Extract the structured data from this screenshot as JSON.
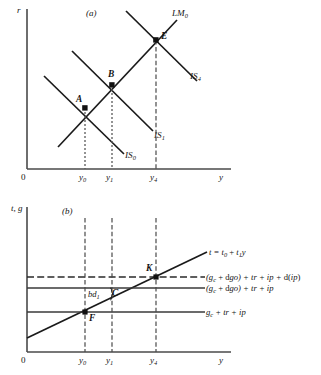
{
  "figure": {
    "panels": [
      {
        "id": "a",
        "panel_label": "(a)",
        "y_axis_label": "r",
        "x_axis_label": "y",
        "origin_label": "0",
        "x_ticks": [
          "y",
          "y",
          "y"
        ],
        "x_tick_subs": [
          "0",
          "1",
          "4"
        ],
        "curves": [
          {
            "name": "LM0",
            "base": "LM",
            "sub": "0",
            "type": "upward"
          },
          {
            "name": "IS0",
            "base": "IS",
            "sub": "0",
            "type": "downward"
          },
          {
            "name": "IS1",
            "base": "IS",
            "sub": "1",
            "type": "downward"
          },
          {
            "name": "IS4",
            "base": "IS",
            "sub": "4",
            "type": "downward"
          }
        ],
        "points": [
          {
            "label": "A",
            "x_tick": "y0"
          },
          {
            "label": "B",
            "x_tick": "y1"
          },
          {
            "label": "E",
            "x_tick": "y4"
          }
        ]
      },
      {
        "id": "b",
        "panel_label": "(b)",
        "y_axis_label": "t, g",
        "x_axis_label": "y",
        "origin_label": "0",
        "x_ticks": [
          "y",
          "y",
          "y"
        ],
        "x_tick_subs": [
          "0",
          "1",
          "4"
        ],
        "equations": [
          {
            "id": "tax-line",
            "text": "t = t0 + t1y",
            "style": "solid-upward"
          },
          {
            "id": "spending-high-dashed",
            "text": "(gc + dgo) + tr + ip + d(ip)",
            "style": "dashed-horizontal"
          },
          {
            "id": "spending-mid",
            "text": "(gc + dgo) + tr + ip",
            "style": "solid-horizontal"
          },
          {
            "id": "spending-low",
            "text": "gc + tr + ip",
            "style": "solid-horizontal"
          }
        ],
        "points": [
          {
            "label": "K",
            "x_tick": "y4"
          },
          {
            "label": "C",
            "x_tick": "y1"
          },
          {
            "label": "F",
            "x_tick": "y0"
          }
        ],
        "annotations": [
          {
            "id": "deficit-bracket",
            "text": "bd",
            "sub": "1"
          }
        ]
      }
    ],
    "colors": {
      "ink": "#141414",
      "axis": "#4a4a4a",
      "guide": "#5a5a5a",
      "background": "#ffffff"
    }
  }
}
